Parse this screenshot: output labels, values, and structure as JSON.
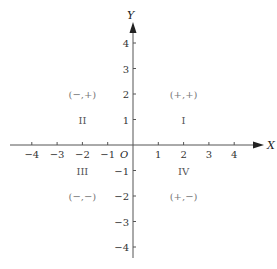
{
  "diagram": {
    "type": "cartesian-plane",
    "x_axis": {
      "label": "X",
      "ticks": [
        -4,
        -3,
        -2,
        -1,
        1,
        2,
        3,
        4
      ],
      "range": [
        -5,
        5
      ]
    },
    "y_axis": {
      "label": "Y",
      "ticks": [
        -4,
        -3,
        -2,
        -1,
        1,
        2,
        3,
        4
      ],
      "range": [
        -4.5,
        5
      ]
    },
    "origin_label": "O",
    "quadrants": [
      {
        "name": "I",
        "signs": "(+,+)",
        "label_at": [
          2,
          1
        ],
        "signs_at": [
          2,
          2
        ]
      },
      {
        "name": "II",
        "signs": "(−,+)",
        "label_at": [
          -2,
          1
        ],
        "signs_at": [
          -2,
          2
        ]
      },
      {
        "name": "III",
        "signs": "(−,−)",
        "label_at": [
          -2,
          -1
        ],
        "signs_at": [
          -2,
          -2
        ]
      },
      {
        "name": "IV",
        "signs": "(+,−)",
        "label_at": [
          2,
          -1
        ],
        "signs_at": [
          2,
          -2
        ]
      }
    ]
  }
}
